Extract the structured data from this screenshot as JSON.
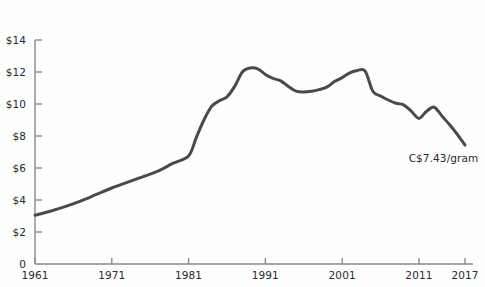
{
  "chart_data": {
    "type": "line",
    "title": "",
    "subtitle": "",
    "xlabel": "",
    "ylabel": "",
    "xlim": [
      1961,
      2017
    ],
    "ylim": [
      0,
      14
    ],
    "grid": false,
    "legend": null,
    "y_ticks": [
      {
        "value": 14,
        "label": "$14"
      },
      {
        "value": 12,
        "label": "$12"
      },
      {
        "value": 10,
        "label": "$10"
      },
      {
        "value": 8,
        "label": "$8"
      },
      {
        "value": 6,
        "label": "$6"
      },
      {
        "value": 4,
        "label": "$4"
      },
      {
        "value": 2,
        "label": "$2"
      },
      {
        "value": 0,
        "label": "0"
      }
    ],
    "x_ticks": [
      {
        "value": 1961,
        "label": "1961"
      },
      {
        "value": 1971,
        "label": "1971"
      },
      {
        "value": 1981,
        "label": "1981"
      },
      {
        "value": 1991,
        "label": "1991"
      },
      {
        "value": 2001,
        "label": "2001"
      },
      {
        "value": 2011,
        "label": "2011"
      },
      {
        "value": 2017,
        "label": "2017"
      }
    ],
    "series": [
      {
        "name": "Price per gram",
        "color": "#4a4a4a",
        "line_width": 3,
        "x": [
          1961,
          1963,
          1965,
          1967,
          1969,
          1971,
          1973,
          1975,
          1977,
          1979,
          1981,
          1982,
          1983,
          1984,
          1985,
          1986,
          1987,
          1988,
          1989,
          1990,
          1991,
          1992,
          1993,
          1994,
          1995,
          1996,
          1997,
          1998,
          1999,
          2000,
          2001,
          2002,
          2003,
          2004,
          2005,
          2006,
          2007,
          2008,
          2009,
          2010,
          2011,
          2012,
          2013,
          2014,
          2015,
          2016,
          2017
        ],
        "values": [
          3.05,
          3.3,
          3.6,
          3.95,
          4.35,
          4.75,
          5.1,
          5.45,
          5.8,
          6.3,
          6.75,
          7.9,
          9.0,
          9.85,
          10.2,
          10.45,
          11.1,
          12.0,
          12.25,
          12.2,
          11.85,
          11.6,
          11.45,
          11.1,
          10.8,
          10.75,
          10.8,
          10.9,
          11.05,
          11.4,
          11.65,
          11.95,
          12.1,
          12.05,
          10.8,
          10.5,
          10.25,
          10.05,
          9.95,
          9.55,
          9.1,
          9.55,
          9.8,
          9.25,
          8.7,
          8.1,
          7.43
        ]
      }
    ],
    "annotations": [
      {
        "text": "C$7.43/gram",
        "x": 2014.2,
        "y": 6.6
      }
    ],
    "axis_color": "#8a8a8a",
    "text_color": "#2b2b2b",
    "background_color": "#fefefe"
  },
  "axes": {
    "y_axis_name": "price-axis",
    "x_axis_name": "year-axis"
  }
}
